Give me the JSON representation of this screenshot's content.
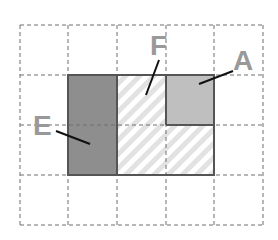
{
  "diagram": {
    "grid": {
      "cols": 5,
      "rows": 4,
      "style": "dashed",
      "color": "#777777"
    },
    "regions": [
      {
        "label": "E",
        "fill": "solid-dark-gray",
        "color": "#8c8c8c",
        "cells": "col 2, rows 2-3"
      },
      {
        "label": "F",
        "fill": "diagonal-hatch",
        "color": "#dddddd",
        "cells": "col 3 rows 2-3, col 4 row 3"
      },
      {
        "label": "A",
        "fill": "solid-light-gray",
        "color": "#bdbdbd",
        "cells": "col 4, row 2"
      }
    ],
    "labels": {
      "a": "A",
      "e": "E",
      "f": "F"
    }
  }
}
